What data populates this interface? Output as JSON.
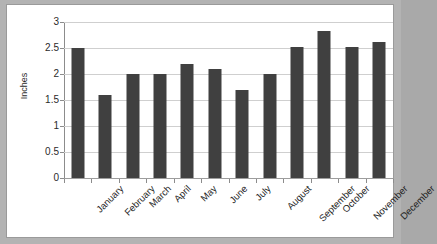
{
  "chart_data": {
    "type": "bar",
    "title": "",
    "xlabel": "",
    "ylabel": "Inches",
    "ylim": [
      0,
      3
    ],
    "yticks": [
      "0",
      "0.5",
      "1",
      "1.5",
      "2",
      "2.5",
      "3"
    ],
    "ytick_values": [
      0,
      0.5,
      1,
      1.5,
      2,
      2.5,
      3
    ],
    "grid": true,
    "legend": false,
    "categories": [
      "January",
      "February",
      "March",
      "April",
      "May",
      "June",
      "July",
      "August",
      "September",
      "October",
      "November",
      "December"
    ],
    "values": [
      2.5,
      1.6,
      2.0,
      2.0,
      2.2,
      2.1,
      1.7,
      2.0,
      2.52,
      2.82,
      2.52,
      2.62
    ],
    "bar_color": "#404040",
    "plot_background": "#ffffff",
    "grid_color": "#cfcfcf",
    "axis_color": "#8c8c8c",
    "frame_color": "#b3b3b3"
  }
}
